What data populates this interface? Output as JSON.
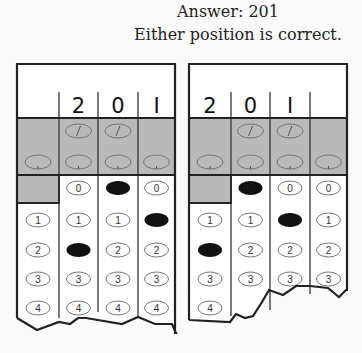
{
  "caption": {
    "answer": "Answer:  201",
    "note": "Either position is correct."
  },
  "colors": {
    "shaded": "#b9b9b9",
    "border": "#222222",
    "filled_bubble": "#111111",
    "bubble_outline": "#777777"
  },
  "grids": [
    {
      "name": "left-grid",
      "x": 17,
      "header_digits": [
        "",
        "2",
        "0",
        "1"
      ],
      "filled": [
        null,
        2,
        0,
        1
      ],
      "torn_edge": "17,318 37,330 59,322 70,324 78,318 86,318 122,324 138,317 155,324 172,324 176,333"
    },
    {
      "name": "right-grid",
      "x": 189,
      "header_digits": [
        "2",
        "0",
        "1",
        ""
      ],
      "filled": [
        2,
        0,
        1,
        null
      ],
      "torn_edge": "189,320 230,322 236,314 245,318 253,316 262,302 269,290 283,295 296,286 310,286 328,288 339,297 346,290"
    }
  ],
  "bubble_rows": [
    "0",
    "1",
    "2",
    "3",
    "4"
  ],
  "special_rows": [
    "fraction-slash",
    "decimal-point"
  ]
}
